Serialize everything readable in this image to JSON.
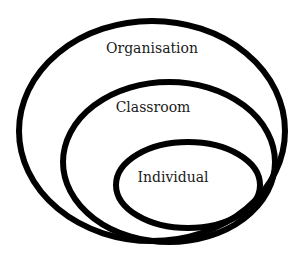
{
  "diagram": {
    "type": "nested-ellipses",
    "stroke_color": "#000000",
    "background": "#ffffff",
    "levels": [
      {
        "id": "organisation",
        "label": "Organisation"
      },
      {
        "id": "classroom",
        "label": "Classroom"
      },
      {
        "id": "individual",
        "label": "Individual"
      }
    ]
  }
}
